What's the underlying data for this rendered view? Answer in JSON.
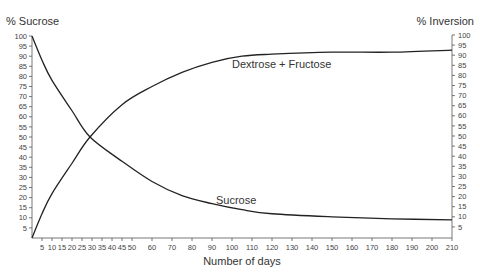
{
  "chart_data": {
    "type": "line",
    "title": "",
    "xlabel": "Number of days",
    "ylabel_left": "% Sucrose",
    "ylabel_right": "% Inversion",
    "xlim": [
      0,
      210
    ],
    "ylim": [
      0,
      100
    ],
    "grid": false,
    "legend": "inline labels",
    "x_ticks": [
      5,
      10,
      15,
      20,
      25,
      30,
      35,
      40,
      45,
      50,
      60,
      70,
      80,
      90,
      100,
      110,
      120,
      130,
      140,
      150,
      160,
      170,
      180,
      190,
      200,
      210
    ],
    "y_ticks_left": [
      5,
      10,
      15,
      20,
      25,
      30,
      35,
      40,
      45,
      50,
      55,
      60,
      65,
      70,
      75,
      80,
      85,
      90,
      95,
      100
    ],
    "y_ticks_right": [
      5,
      10,
      15,
      20,
      25,
      30,
      35,
      40,
      45,
      50,
      55,
      60,
      65,
      70,
      75,
      80,
      85,
      90,
      95,
      100
    ],
    "series": [
      {
        "name": "Sucrose",
        "x": [
          0,
          5,
          10,
          20,
          29,
          45,
          60,
          75,
          90,
          105,
          120,
          150,
          180,
          210
        ],
        "values": [
          100,
          88,
          78,
          63,
          50,
          38,
          28,
          21,
          17,
          14,
          12,
          10.5,
          9.5,
          9
        ]
      },
      {
        "name": "Dextrose + Fructose",
        "x": [
          0,
          5,
          10,
          20,
          29,
          45,
          60,
          75,
          90,
          105,
          120,
          150,
          180,
          210
        ],
        "values": [
          0,
          12,
          22,
          37,
          50,
          66,
          75,
          82,
          87,
          90,
          91,
          92,
          92,
          93
        ]
      }
    ],
    "annotations": [
      {
        "text": "Dextrose + Fructose",
        "x": 100,
        "y": 84
      },
      {
        "text": "Sucrose",
        "x": 92,
        "y": 17
      }
    ]
  }
}
